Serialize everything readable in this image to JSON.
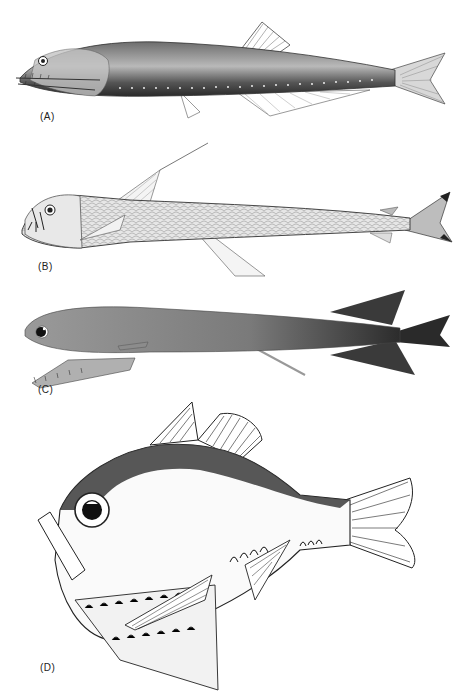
{
  "figure": {
    "panels": [
      {
        "id": "A",
        "label": "(A)",
        "subject": "dragonfish-elongate-fish"
      },
      {
        "id": "B",
        "label": "(B)",
        "subject": "viperfish-with-long-dorsal-ray"
      },
      {
        "id": "C",
        "label": "(C)",
        "subject": "loosejaw-dragonfish"
      },
      {
        "id": "D",
        "label": "(D)",
        "subject": "hatchetfish"
      }
    ],
    "colors": {
      "ink": "#1a1a1a",
      "paper": "#ffffff",
      "body_shade": "#8a8a8a",
      "dark_shade": "#3a3a3a"
    }
  }
}
